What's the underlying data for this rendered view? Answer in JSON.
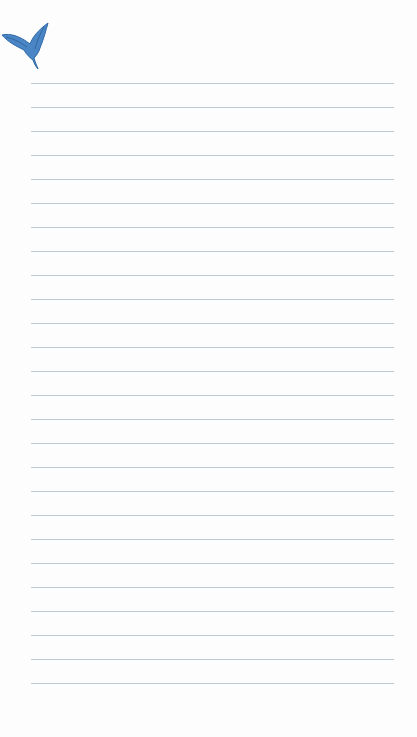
{
  "page": {
    "type": "lined-notepaper",
    "background_color": "#fdfdfe",
    "line_color": "#b9cbd8",
    "decoration": {
      "icon": "hummingbird-icon",
      "color": "#3f79b8"
    },
    "lines": {
      "count": 26,
      "first_y": 83,
      "spacing": 24,
      "left": 31,
      "width": 363
    }
  }
}
